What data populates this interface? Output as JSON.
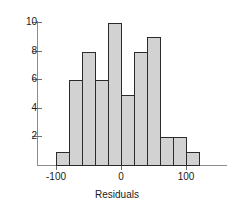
{
  "chart_data": {
    "type": "bar",
    "title": "",
    "xlabel": "Residuals",
    "ylabel": "",
    "categories": [
      "-100 to -80",
      "-80 to -60",
      "-60 to -40",
      "-40 to -20",
      "-20 to 0",
      "0 to 20",
      "20 to 40",
      "40 to 60",
      "60 to 80",
      "80 to 100",
      "100 to 120"
    ],
    "bin_edges": [
      -100,
      -80,
      -60,
      -40,
      -20,
      0,
      20,
      40,
      60,
      80,
      100,
      120
    ],
    "values": [
      1,
      6,
      8,
      6,
      10,
      5,
      8,
      9,
      2,
      2,
      1
    ],
    "bin_width": 20,
    "total_count": 58,
    "xlim": [
      -120,
      140
    ],
    "ylim": [
      0,
      10.6
    ],
    "x_ticks": [
      -100,
      0,
      100
    ],
    "x_tick_labels": [
      "-100",
      "0",
      "100"
    ],
    "y_ticks": [
      2,
      4,
      6,
      8,
      10
    ],
    "y_tick_labels": [
      "2",
      "4",
      "6",
      "8",
      "10"
    ],
    "grid": false,
    "legend": null,
    "bar_fill_color": "#d2d2d2",
    "bar_edge_color": "#2b2b2b",
    "axis_color": "#8c8c8c",
    "text_color": "#1a1a1a",
    "background_color": "#ffffff"
  }
}
